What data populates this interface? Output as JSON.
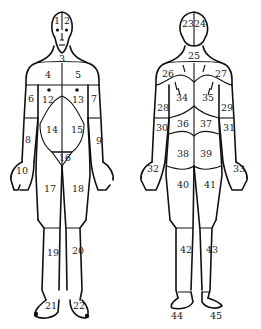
{
  "diagram": {
    "title": "",
    "ink_color": "#111111",
    "background_color": "#ffffff",
    "figures": [
      {
        "view": "front",
        "regions": [
          {
            "id": "1",
            "label": "1"
          },
          {
            "id": "2",
            "label": "2"
          },
          {
            "id": "3",
            "label": "3"
          },
          {
            "id": "4",
            "label": "4"
          },
          {
            "id": "5",
            "label": "5"
          },
          {
            "id": "6",
            "label": "6"
          },
          {
            "id": "7",
            "label": "7"
          },
          {
            "id": "8",
            "label": "8"
          },
          {
            "id": "9",
            "label": "9"
          },
          {
            "id": "10",
            "label": "10"
          },
          {
            "id": "12",
            "label": "12"
          },
          {
            "id": "13",
            "label": "13"
          },
          {
            "id": "14",
            "label": "14"
          },
          {
            "id": "15",
            "label": "15"
          },
          {
            "id": "16",
            "label": "16"
          },
          {
            "id": "17",
            "label": "17"
          },
          {
            "id": "18",
            "label": "18"
          },
          {
            "id": "19",
            "label": "19"
          },
          {
            "id": "20",
            "label": "20"
          },
          {
            "id": "21",
            "label": "21"
          },
          {
            "id": "22",
            "label": "22"
          }
        ]
      },
      {
        "view": "back",
        "regions": [
          {
            "id": "23",
            "label": "23"
          },
          {
            "id": "24",
            "label": "24"
          },
          {
            "id": "25",
            "label": "25"
          },
          {
            "id": "26",
            "label": "26"
          },
          {
            "id": "27",
            "label": "27"
          },
          {
            "id": "28",
            "label": "28"
          },
          {
            "id": "29",
            "label": "29"
          },
          {
            "id": "30",
            "label": "30"
          },
          {
            "id": "31",
            "label": "31"
          },
          {
            "id": "32",
            "label": "32"
          },
          {
            "id": "33",
            "label": "33"
          },
          {
            "id": "34",
            "label": "34"
          },
          {
            "id": "35",
            "label": "35"
          },
          {
            "id": "36",
            "label": "36"
          },
          {
            "id": "37",
            "label": "37"
          },
          {
            "id": "38",
            "label": "38"
          },
          {
            "id": "39",
            "label": "39"
          },
          {
            "id": "40",
            "label": "40"
          },
          {
            "id": "41",
            "label": "41"
          },
          {
            "id": "42",
            "label": "42"
          },
          {
            "id": "43",
            "label": "43"
          },
          {
            "id": "44",
            "label": "44"
          },
          {
            "id": "45",
            "label": "45"
          }
        ]
      }
    ]
  }
}
